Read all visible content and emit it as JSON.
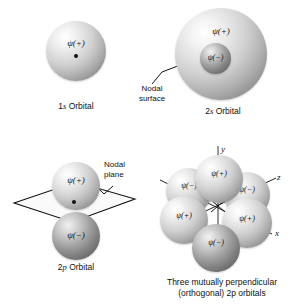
{
  "figure": {
    "psi_plus": "ψ(+)",
    "psi_minus": "ψ(−)"
  },
  "panels": {
    "s1": {
      "label_prefix": "1",
      "label_italic": "s",
      "label_suffix": " Orbital",
      "lobe_sign": "ψ(+)"
    },
    "s2": {
      "label_prefix": "2",
      "label_italic": "s",
      "label_suffix": " Orbital",
      "outer_sign": "ψ(+)",
      "inner_sign": "ψ(−)",
      "annotation_line1": "Nodal",
      "annotation_line2": "surface"
    },
    "p2": {
      "label_prefix": "2",
      "label_italic": "p",
      "label_suffix": " Orbital",
      "top_sign": "ψ(+)",
      "bottom_sign": "ψ(−)",
      "annotation_line1": "Nodal",
      "annotation_line2": "plane"
    },
    "p2set": {
      "caption_line1": "Three mutually perpendicular",
      "caption_line2_a": "(orthogonal) 2",
      "caption_line2_italic": "p",
      "caption_line2_b": " orbitals",
      "axis_y": "y",
      "axis_z": "z",
      "axis_x": "x",
      "lobes": [
        {
          "sign": "ψ(+)",
          "position": "top"
        },
        {
          "sign": "ψ(−)",
          "position": "upper-left"
        },
        {
          "sign": "ψ(−)",
          "position": "upper-right"
        },
        {
          "sign": "ψ(+)",
          "position": "lower-left"
        },
        {
          "sign": "ψ(+)",
          "position": "lower-right"
        },
        {
          "sign": "ψ(−)",
          "position": "bottom"
        }
      ]
    }
  },
  "colors": {
    "background": "#ffffff",
    "ink": "#111111",
    "sphere_light": "#ffffff",
    "sphere_shadow": "#7d7d7d"
  }
}
